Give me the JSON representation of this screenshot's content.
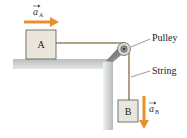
{
  "diagram": {
    "type": "physics-pulley-system",
    "blocks": [
      {
        "id": "A",
        "label": "A"
      },
      {
        "id": "B",
        "label": "B"
      }
    ],
    "vectors": [
      {
        "id": "aA",
        "symbol": "a",
        "subscript": "A",
        "direction": "right"
      },
      {
        "id": "aB",
        "symbol": "a",
        "subscript": "B",
        "direction": "down"
      }
    ],
    "labels": {
      "pulley": "Pulley",
      "string": "String"
    },
    "colors": {
      "arrow": "#e8902a",
      "block_fill": "#ebe6dc",
      "block_stroke": "#555555",
      "table": "#c9cccc",
      "string": "#b8a98a"
    }
  }
}
